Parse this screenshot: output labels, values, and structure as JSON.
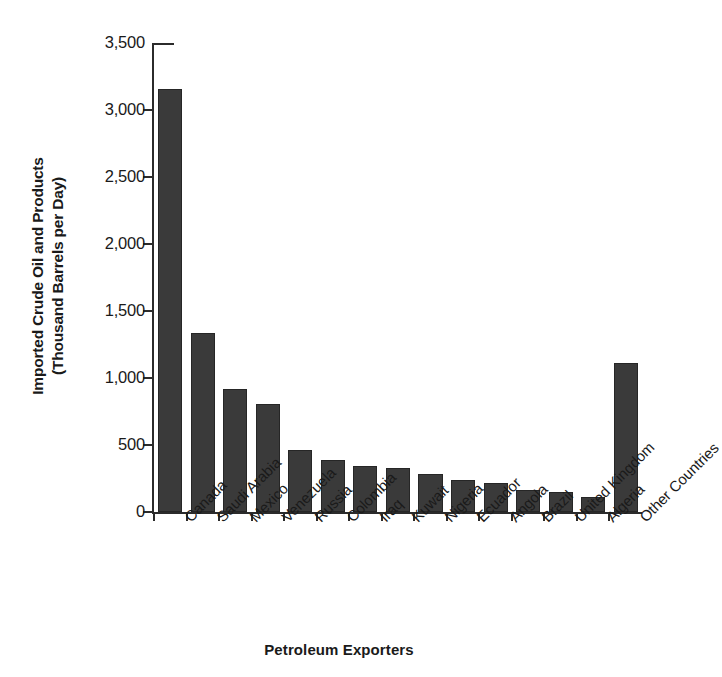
{
  "chart_data": {
    "type": "bar",
    "title": "",
    "xlabel": "Petroleum Exporters",
    "ylabel": "Imported Crude Oil and Products (Thousand Barrels per Day)",
    "ylabel_lines": [
      "Imported Crude Oil and Products",
      "(Thousand Barrels per Day)"
    ],
    "categories": [
      "Canada",
      "Saudi Arabia",
      "Mexico",
      "Venezuela",
      "Russia",
      "Colombia",
      "Iraq",
      "Kuwait",
      "Nigeria",
      "Ecuador",
      "Angola",
      "Brazil",
      "United Kingdom",
      "Algeria",
      "Other Countries"
    ],
    "values": [
      3155,
      1335,
      915,
      805,
      460,
      390,
      340,
      325,
      285,
      240,
      220,
      165,
      150,
      115,
      1110
    ],
    "ylim": [
      0,
      3500
    ],
    "y_ticks": [
      0,
      500,
      1000,
      1500,
      2000,
      2500,
      3000,
      3500
    ],
    "y_tick_labels": [
      "0",
      "500",
      "1,000",
      "1,500",
      "2,000",
      "2,500",
      "3,000",
      "3,500"
    ],
    "grid": false,
    "legend": false,
    "bar_color": "#3a3a3a",
    "axis_color": "#2b2b2b",
    "background": "#ffffff"
  }
}
